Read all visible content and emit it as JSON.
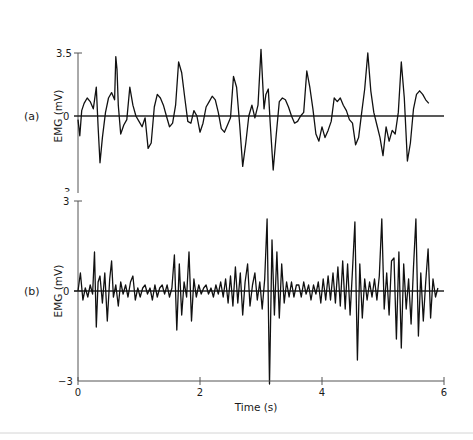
{
  "chart_data": [
    {
      "type": "line",
      "panel_label": "(a)",
      "title": "",
      "xlabel": "",
      "ylabel": "EMG (mV)",
      "ylim": [
        -3.5,
        3.5
      ],
      "xlim": [
        0,
        6
      ],
      "y_ticks": [
        "3.5",
        "0"
      ],
      "grid": false,
      "series": [
        {
          "name": "EMG (a)",
          "x": [
            0.0,
            0.03,
            0.06,
            0.1,
            0.15,
            0.2,
            0.25,
            0.3,
            0.33,
            0.36,
            0.4,
            0.45,
            0.5,
            0.55,
            0.6,
            0.62,
            0.64,
            0.66,
            0.7,
            0.75,
            0.8,
            0.85,
            0.9,
            0.95,
            1.0,
            1.05,
            1.1,
            1.15,
            1.2,
            1.25,
            1.3,
            1.35,
            1.4,
            1.45,
            1.5,
            1.55,
            1.6,
            1.65,
            1.7,
            1.75,
            1.8,
            1.85,
            1.9,
            1.95,
            2.0,
            2.05,
            2.1,
            2.15,
            2.2,
            2.25,
            2.3,
            2.35,
            2.4,
            2.45,
            2.5,
            2.55,
            2.6,
            2.65,
            2.7,
            2.75,
            2.8,
            2.85,
            2.9,
            2.95,
            3.0,
            3.05,
            3.08,
            3.12,
            3.15,
            3.2,
            3.25,
            3.3,
            3.35,
            3.4,
            3.45,
            3.5,
            3.55,
            3.6,
            3.65,
            3.7,
            3.75,
            3.8,
            3.85,
            3.9,
            3.95,
            4.0,
            4.05,
            4.1,
            4.15,
            4.2,
            4.25,
            4.3,
            4.35,
            4.4,
            4.45,
            4.5,
            4.55,
            4.6,
            4.65,
            4.7,
            4.75,
            4.8,
            4.85,
            4.9,
            4.95,
            5.0,
            5.05,
            5.1,
            5.15,
            5.2,
            5.25,
            5.3,
            5.35,
            5.4,
            5.45,
            5.5,
            5.55,
            5.6,
            5.65,
            5.7,
            5.75,
            5.8,
            5.85,
            5.9
          ],
          "values": [
            -0.2,
            -1.1,
            0.3,
            0.7,
            1.0,
            0.8,
            0.4,
            1.6,
            -0.6,
            -2.6,
            -1.2,
            0.2,
            1.0,
            1.3,
            0.9,
            3.3,
            2.6,
            0.6,
            -1.0,
            -0.5,
            -0.2,
            1.6,
            0.6,
            0.0,
            -0.3,
            -0.6,
            -0.1,
            -1.8,
            -1.5,
            0.5,
            1.2,
            1.0,
            0.6,
            0.0,
            -0.6,
            -0.4,
            0.6,
            3.0,
            2.4,
            1.0,
            -0.3,
            -0.4,
            0.3,
            0.0,
            -0.9,
            -0.4,
            0.5,
            0.8,
            1.1,
            0.9,
            0.2,
            -0.7,
            -0.9,
            -0.5,
            -0.1,
            2.2,
            1.6,
            -0.5,
            -2.8,
            -1.5,
            0.0,
            0.6,
            -0.1,
            0.6,
            3.7,
            0.4,
            1.2,
            1.5,
            -0.3,
            -3.0,
            -1.0,
            0.8,
            1.0,
            0.9,
            0.5,
            0.0,
            -0.4,
            -0.3,
            0.0,
            0.2,
            2.5,
            1.6,
            0.4,
            -1.0,
            -1.4,
            -0.6,
            -1.2,
            -0.8,
            -0.3,
            1.0,
            0.8,
            1.0,
            0.6,
            0.3,
            -0.2,
            -0.4,
            -1.6,
            -1.2,
            0.2,
            1.5,
            3.5,
            1.4,
            0.2,
            -0.5,
            -1.2,
            -2.2,
            -0.6,
            -1.4,
            -0.8,
            -1.0,
            0.2,
            3.0,
            1.0,
            -2.5,
            -1.5,
            0.4,
            1.2,
            1.4,
            1.2,
            0.9,
            0.7
          ]
        }
      ]
    },
    {
      "type": "line",
      "panel_label": "(b)",
      "title": "",
      "xlabel": "Time (s)",
      "ylabel": "EMG (mV)",
      "ylim": [
        -3,
        3
      ],
      "xlim": [
        0,
        6
      ],
      "x_ticks": [
        "0",
        "2",
        "4",
        "6"
      ],
      "y_ticks": [
        "3",
        "0",
        "−3"
      ],
      "grid": false,
      "series": [
        {
          "name": "EMG (b)",
          "x": [
            0.0,
            0.04,
            0.08,
            0.12,
            0.16,
            0.2,
            0.24,
            0.27,
            0.3,
            0.33,
            0.36,
            0.4,
            0.44,
            0.48,
            0.52,
            0.55,
            0.58,
            0.62,
            0.66,
            0.7,
            0.74,
            0.78,
            0.82,
            0.86,
            0.9,
            0.94,
            0.98,
            1.02,
            1.06,
            1.1,
            1.14,
            1.18,
            1.22,
            1.26,
            1.3,
            1.34,
            1.38,
            1.42,
            1.46,
            1.5,
            1.54,
            1.58,
            1.62,
            1.66,
            1.7,
            1.74,
            1.78,
            1.82,
            1.86,
            1.9,
            1.94,
            1.98,
            2.02,
            2.06,
            2.1,
            2.14,
            2.18,
            2.22,
            2.26,
            2.3,
            2.34,
            2.38,
            2.42,
            2.46,
            2.5,
            2.54,
            2.58,
            2.62,
            2.66,
            2.7,
            2.74,
            2.78,
            2.82,
            2.86,
            2.9,
            2.94,
            2.98,
            3.02,
            3.06,
            3.1,
            3.14,
            3.18,
            3.22,
            3.26,
            3.3,
            3.34,
            3.38,
            3.42,
            3.46,
            3.5,
            3.54,
            3.58,
            3.62,
            3.66,
            3.7,
            3.74,
            3.78,
            3.82,
            3.86,
            3.9,
            3.94,
            3.98,
            4.02,
            4.06,
            4.1,
            4.14,
            4.18,
            4.22,
            4.26,
            4.3,
            4.34,
            4.38,
            4.42,
            4.46,
            4.5,
            4.54,
            4.58,
            4.62,
            4.66,
            4.7,
            4.74,
            4.78,
            4.82,
            4.86,
            4.9,
            4.94,
            4.98,
            5.02,
            5.06,
            5.1,
            5.14,
            5.18,
            5.22,
            5.26,
            5.3,
            5.34,
            5.38,
            5.42,
            5.46,
            5.5,
            5.54,
            5.58,
            5.62,
            5.66,
            5.7,
            5.74,
            5.78,
            5.82,
            5.86,
            5.9
          ],
          "values": [
            0.0,
            0.6,
            -0.3,
            0.1,
            -0.2,
            0.2,
            -0.1,
            1.3,
            -1.2,
            0.3,
            0.5,
            -0.4,
            0.6,
            -1.0,
            0.4,
            1.0,
            -0.2,
            0.2,
            -0.5,
            0.3,
            -0.1,
            0.2,
            -0.2,
            0.3,
            0.5,
            -0.3,
            0.1,
            -0.2,
            0.1,
            0.2,
            -0.1,
            0.1,
            -0.3,
            0.2,
            -0.2,
            0.1,
            0.2,
            -0.1,
            0.2,
            -0.2,
            0.1,
            1.2,
            -1.3,
            0.9,
            -0.8,
            0.3,
            -0.2,
            1.3,
            -1.0,
            0.4,
            -0.2,
            0.2,
            -0.1,
            0.1,
            0.2,
            -0.1,
            0.1,
            -0.2,
            0.2,
            -0.1,
            0.3,
            -0.2,
            0.4,
            -0.4,
            0.5,
            -0.5,
            0.8,
            -0.4,
            0.6,
            -0.8,
            0.3,
            0.9,
            -0.5,
            0.2,
            0.6,
            -0.3,
            0.3,
            -0.6,
            0.4,
            2.4,
            -3.1,
            1.7,
            -0.8,
            1.3,
            -0.9,
            0.9,
            -0.4,
            0.3,
            -0.2,
            0.3,
            -0.2,
            0.2,
            0.2,
            -0.2,
            0.3,
            -0.1,
            0.2,
            -0.3,
            0.2,
            -0.1,
            0.3,
            -0.4,
            0.4,
            -0.3,
            0.5,
            -0.3,
            0.6,
            -0.4,
            0.8,
            -0.5,
            1.0,
            -0.6,
            0.9,
            -0.8,
            0.7,
            2.3,
            -2.3,
            0.9,
            -0.9,
            0.4,
            -0.3,
            0.3,
            -0.2,
            0.4,
            -0.3,
            0.5,
            2.4,
            -0.6,
            0.6,
            -0.8,
            1.0,
            1.1,
            -1.6,
            1.3,
            -1.9,
            0.9,
            -0.6,
            0.4,
            -1.1,
            0.8,
            2.4,
            -1.5,
            0.6,
            -1.0,
            0.3,
            1.4,
            -0.9,
            0.4,
            -0.2,
            0.1
          ]
        }
      ]
    }
  ],
  "labels": {
    "panel_a": "(a)",
    "panel_b": "(b)",
    "ylabel_a": "EMG (mV)",
    "ylabel_b": "EMG (mV)",
    "a_ytick_top": "3.5",
    "a_ytick_zero": "0",
    "a_ytick_bottom": "3",
    "b_ytick_top": "3",
    "b_ytick_zero": "0",
    "b_ytick_bottom": "−3",
    "xtick_0": "0",
    "xtick_2": "2",
    "xtick_4": "4",
    "xtick_6": "6",
    "xlabel": "Time (s)"
  },
  "colors": {
    "trace": "#111111",
    "axis": "#555555",
    "separator": "#d4d4d4"
  }
}
